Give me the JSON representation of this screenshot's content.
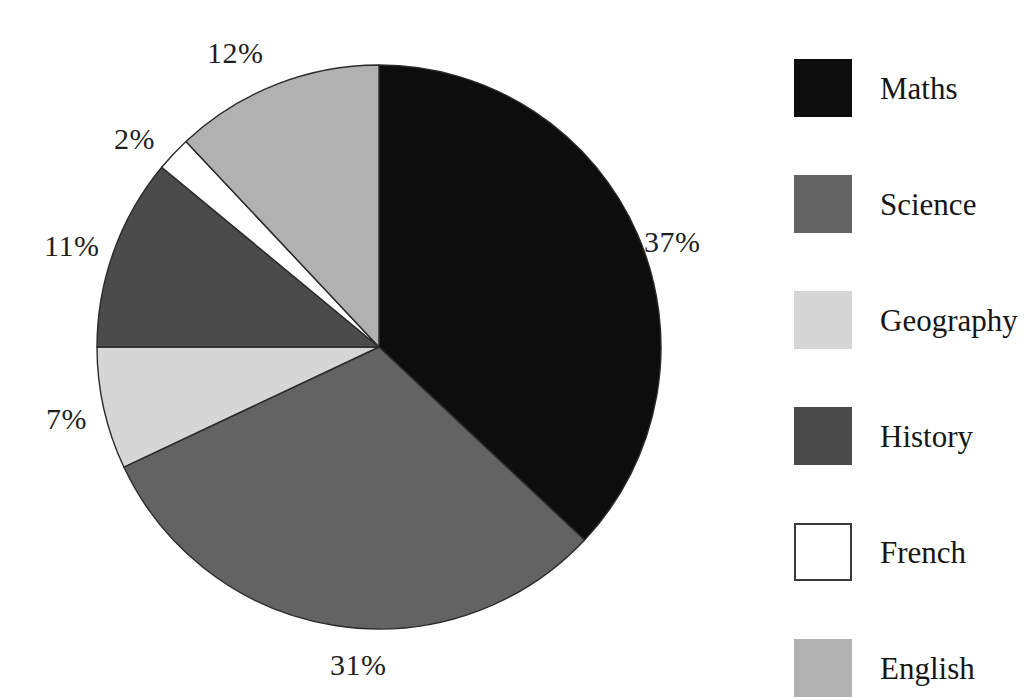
{
  "chart_data": {
    "type": "pie",
    "title": "",
    "subtitle": "",
    "xlabel": "",
    "ylabel": "",
    "grid": false,
    "legend_position": "right",
    "start_angle_deg": 0,
    "direction": "clockwise",
    "units": "percent",
    "categories": [
      "Maths",
      "Science",
      "Geography",
      "History",
      "French",
      "English"
    ],
    "values": [
      37,
      31,
      7,
      11,
      2,
      12
    ],
    "data_labels": [
      "37%",
      "31%",
      "7%",
      "11%",
      "2%",
      "12%"
    ],
    "colors": [
      "#0d0d0d",
      "#636363",
      "#d6d6d6",
      "#4b4b4b",
      "#ffffff",
      "#b1b1b1"
    ],
    "slices": [
      {
        "label": "Maths",
        "value": 37,
        "data_label": "37%",
        "color": "#0d0d0d",
        "label_x": 644,
        "label_y": 227
      },
      {
        "label": "Science",
        "value": 31,
        "data_label": "31%",
        "color": "#636363",
        "label_x": 330,
        "label_y": 650
      },
      {
        "label": "Geography",
        "value": 7,
        "data_label": "7%",
        "color": "#d6d6d6",
        "label_x": 46,
        "label_y": 404
      },
      {
        "label": "History",
        "value": 11,
        "data_label": "11%",
        "color": "#4b4b4b",
        "label_x": 44,
        "label_y": 231
      },
      {
        "label": "French",
        "value": 2,
        "data_label": "2%",
        "color": "#ffffff",
        "label_x": 114,
        "label_y": 124
      },
      {
        "label": "English",
        "value": 12,
        "data_label": "12%",
        "color": "#b1b1b1",
        "label_x": 207,
        "label_y": 38
      }
    ]
  },
  "legend": {
    "items": [
      {
        "label": "Maths",
        "color": "#0d0d0d",
        "bordered": false,
        "top": 0
      },
      {
        "label": "Science",
        "color": "#636363",
        "bordered": false,
        "top": 116
      },
      {
        "label": "Geography",
        "color": "#d6d6d6",
        "bordered": false,
        "top": 232
      },
      {
        "label": "History",
        "color": "#4b4b4b",
        "bordered": false,
        "top": 348
      },
      {
        "label": "French",
        "color": "#ffffff",
        "bordered": true,
        "top": 464
      },
      {
        "label": "English",
        "color": "#b1b1b1",
        "bordered": false,
        "top": 580
      }
    ]
  },
  "geometry": {
    "center_x": 379,
    "center_y": 347,
    "radius": 282
  }
}
